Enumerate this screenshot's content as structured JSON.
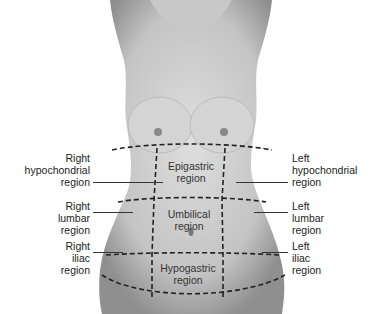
{
  "diagram": {
    "type": "anatomy",
    "labels": {
      "right_hypochondrial": "Right\nhypochondrial\nregion",
      "right_lumbar": "Right\nlumbar\nregion",
      "right_iliac": "Right\niliac\nregion",
      "epigastric": "Epigastric\nregion",
      "umbilical": "Umbilical\nregion",
      "hypogastric": "Hypogastric\nregion",
      "left_hypochondrial": "Left\nhypochondrial\nregion",
      "left_lumbar": "Left\nlumbar\nregion",
      "left_iliac": "Left\niliac\nregion"
    },
    "colors": {
      "skin_light": "#d9d9d9",
      "skin_dark": "#9a9a9a",
      "grid_line": "#222222",
      "label_text": "#222222"
    }
  }
}
